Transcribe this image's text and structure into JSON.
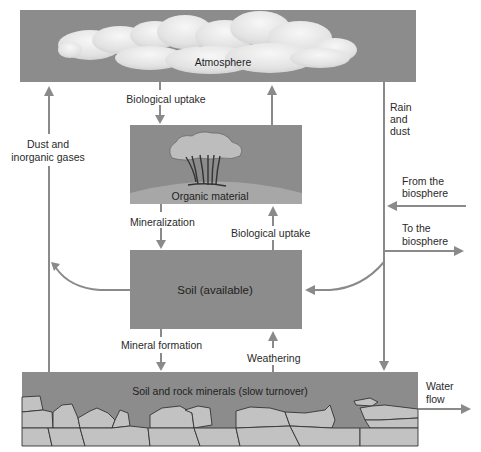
{
  "colors": {
    "box_fill": "#8c8c8c",
    "cloud_fill": "#e6e6e6",
    "arrow": "#8a8a8a",
    "rock_fill": "#c2c2c2",
    "ground_fill": "#a7a7a7",
    "text": "#2a2a2a"
  },
  "boxes": {
    "atmosphere": {
      "label": "Atmosphere"
    },
    "organic": {
      "label": "Organic material"
    },
    "soil": {
      "label": "Soil  (available)"
    },
    "rock": {
      "label": "Soil and rock minerals (slow turnover)"
    }
  },
  "flows": {
    "bio_uptake_top": "Biological uptake",
    "dust_gases": [
      "Dust and",
      "inorganic gases"
    ],
    "rain_dust": [
      "Rain",
      "and",
      "dust"
    ],
    "from_biosphere": [
      "From the",
      "biosphere"
    ],
    "to_biosphere": [
      "To the",
      "biosphere"
    ],
    "mineralization": "Mineralization",
    "bio_uptake_mid": "Biological uptake",
    "mineral_formation": "Mineral formation",
    "weathering": "Weathering",
    "water_flow": [
      "Water",
      "flow"
    ]
  }
}
